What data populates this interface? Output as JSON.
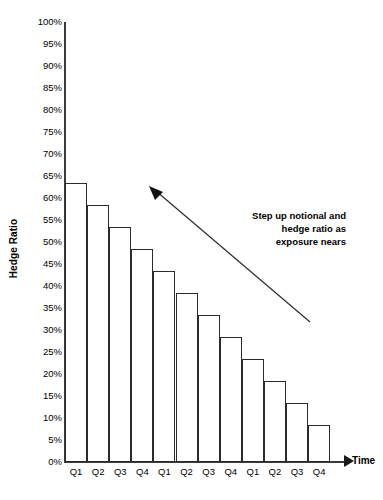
{
  "chart_data": {
    "type": "bar",
    "title": "",
    "subtitle": "",
    "xlabel": "Time",
    "ylabel": "Hedge Ratio",
    "categories": [
      "Q1",
      "Q2",
      "Q3",
      "Q4",
      "Q1",
      "Q2",
      "Q3",
      "Q4",
      "Q1",
      "Q2",
      "Q3",
      "Q4"
    ],
    "values": [
      63.5,
      58.5,
      53.5,
      48.5,
      43.5,
      38.5,
      33.5,
      28.5,
      23.5,
      18.5,
      13.5,
      8.5
    ],
    "value_labels": [
      "63.5%",
      "58.5%",
      "53.5%",
      "48.5%",
      "43.5%",
      "38.5%",
      "33.5%",
      "28.5%",
      "23.5%",
      "18.5%",
      "13.5%",
      "8.5%"
    ],
    "ylim": [
      0,
      100
    ],
    "ytick_values": [
      100,
      95,
      90,
      85,
      80,
      75,
      70,
      65,
      60,
      55,
      50,
      45,
      40,
      35,
      30,
      25,
      20,
      15,
      10,
      5,
      0
    ],
    "ytick_labels": [
      "100%",
      "95%",
      "90%",
      "85%",
      "80%",
      "75%",
      "70%",
      "65%",
      "60%",
      "55%",
      "50%",
      "45%",
      "40%",
      "35%",
      "30%",
      "25%",
      "20%",
      "15%",
      "10%",
      "5%",
      "0%"
    ],
    "grid": false,
    "legend": null,
    "bar_fill_color": "#ffffff",
    "bar_border_color": "#2b2b2b",
    "axis_color": "#3b3b3b",
    "annotations": [
      {
        "name": "step-up-note",
        "lines": [
          "Step up notional and",
          "hedge ratio as",
          "exposure nears"
        ],
        "text": "Step up notional and hedge ratio as exposure nears",
        "align": "right",
        "bold": true,
        "arrow": {
          "from_x": 310,
          "from_y": 322,
          "to_x": 151,
          "to_y": 187,
          "head": "triangle",
          "color": "#2b2b2b"
        }
      }
    ]
  },
  "axes": {
    "y_title": "Hedge Ratio",
    "x_title": "Time"
  }
}
